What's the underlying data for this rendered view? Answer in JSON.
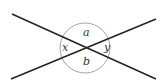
{
  "diagram": {
    "labels": {
      "top": "a",
      "bottom": "b",
      "left": "x",
      "right": "y"
    },
    "colors": {
      "line": "#222222",
      "circle": "#9a9a9a",
      "text": "#333333"
    }
  }
}
